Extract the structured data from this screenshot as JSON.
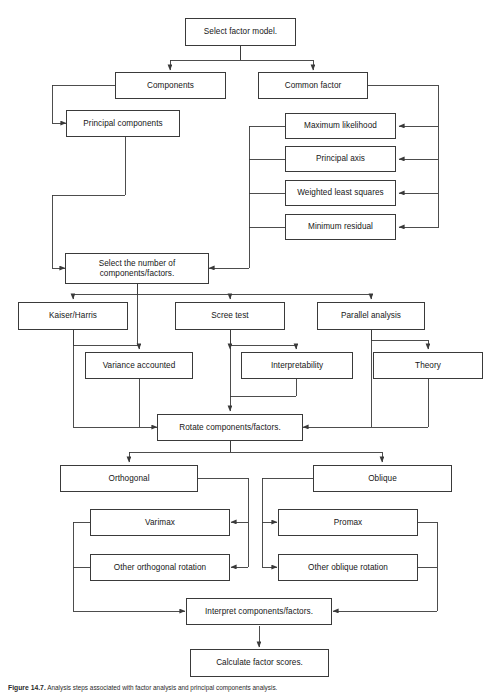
{
  "figure": {
    "caption_label": "Figure 14.7.",
    "caption_text": "Analysis steps associated with factor analysis and principal components analysis."
  },
  "nodes": {
    "select_factor_model": "Select factor model.",
    "components": "Components",
    "common_factor": "Common factor",
    "principal_components": "Principal components",
    "maximum_likelihood": "Maximum likelihood",
    "principal_axis": "Principal axis",
    "weighted_least_squares": "Weighted least squares",
    "minimum_residual": "Minimum residual",
    "select_number": "Select the number of\ncomponents/factors.",
    "kaiser_harris": "Kaiser/Harris",
    "scree_test": "Scree test",
    "parallel_analysis": "Parallel analysis",
    "variance_accounted": "Variance accounted",
    "interpretability": "Interpretability",
    "theory": "Theory",
    "rotate": "Rotate components/factors.",
    "orthogonal": "Orthogonal",
    "oblique": "Oblique",
    "varimax": "Varimax",
    "promax": "Promax",
    "other_orthogonal": "Other orthogonal rotation",
    "other_oblique": "Other oblique rotation",
    "interpret": "Interpret components/factors.",
    "calculate_scores": "Calculate factor scores."
  },
  "style": {
    "line_color": "#3a3a3a",
    "box_border": "#3a3a3a",
    "background": "#ffffff",
    "text_color": "#161616"
  }
}
